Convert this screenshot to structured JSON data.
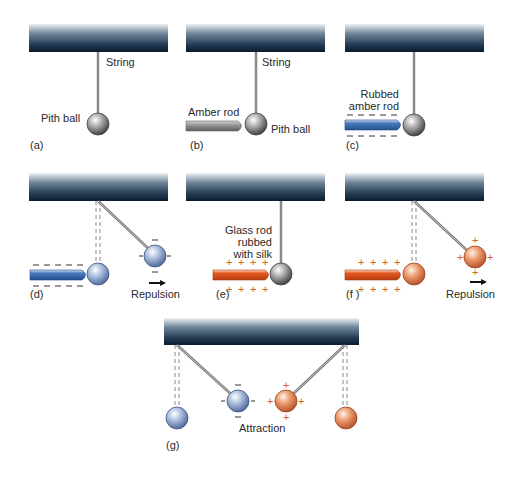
{
  "figure": {
    "colors": {
      "support_top": "#f2f4f6",
      "support_bottom": "#0e2238",
      "string": "#8a8a8a",
      "neutral_ball": "#7a7a7a",
      "negative_ball": "#9fb3d6",
      "positive_ball": "#e5936a",
      "amber_rod": "#8c8c8c",
      "rubbed_amber_rod": "#3c6fb8",
      "glass_rod": "#e0521f",
      "plus_sign": "#d9622a",
      "minus_sign": "#333333"
    },
    "panels": [
      {
        "id": "a",
        "caption": "(a)",
        "labels": {
          "string": "String",
          "ball": "Pith ball"
        }
      },
      {
        "id": "b",
        "caption": "(b)",
        "labels": {
          "string": "String",
          "rod": "Amber rod",
          "ball": "Pith ball"
        }
      },
      {
        "id": "c",
        "caption": "(c)",
        "labels": {
          "rod_line1": "Rubbed",
          "rod_line2": "amber rod"
        }
      },
      {
        "id": "d",
        "caption": "(d)",
        "labels": {
          "effect": "Repulsion"
        }
      },
      {
        "id": "e",
        "caption": "(e)",
        "labels": {
          "rod_line1": "Glass rod",
          "rod_line2": "rubbed",
          "rod_line3": "with silk"
        }
      },
      {
        "id": "f",
        "caption": "(f )",
        "labels": {
          "effect": "Repulsion"
        }
      },
      {
        "id": "g",
        "caption": "(g)",
        "labels": {
          "effect": "Attraction"
        }
      }
    ],
    "symbols": {
      "minus": "−",
      "plus": "+"
    }
  }
}
